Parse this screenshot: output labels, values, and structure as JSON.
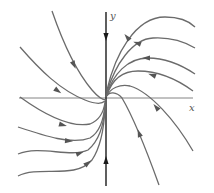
{
  "figure": {
    "type": "phase-portrait",
    "colors": {
      "axis": "#1a1a1a",
      "trajectory": "#6b6b6b",
      "background": "#ffffff"
    },
    "axes": {
      "x_label": "x",
      "y_label": "y"
    },
    "trajectories": {
      "right_upper": [
        {
          "id": "r1",
          "path": "M107,90 C115,55 135,17 165,17 C180,17 190,22 195,27"
        },
        {
          "id": "r2",
          "path": "M107,92 C115,65 132,39 153,38 C170,37 185,42 195,48"
        },
        {
          "id": "r3",
          "path": "M107,94 C113,75 127,58 148,58 C168,58 183,66 195,74"
        },
        {
          "id": "r4",
          "path": "M107,95 C112,80 122,71 138,71 C158,71 178,80 193,91"
        },
        {
          "id": "r5",
          "path": "M107,96 C110,88 120,84 130,86 C150,92 175,120 193,151"
        },
        {
          "id": "r6",
          "path": "M107,96 C109,92 116,91 122,98 C135,120 150,160 159,185"
        }
      ],
      "left": [
        {
          "id": "l1",
          "path": "M52,11 C62,40 75,70 92,90 C98,97 103,100 106,100"
        },
        {
          "id": "l2",
          "path": "M20,47 C40,70 60,90 85,100 C95,104 102,104 105,101"
        },
        {
          "id": "l3",
          "path": "M20,97 C45,115 70,128 90,124 C100,120 104,110 105,102"
        },
        {
          "id": "l4",
          "path": "M18,127 C45,136 72,145 90,138 C100,132 104,118 105,104"
        },
        {
          "id": "l5",
          "path": "M18,154 C40,145 70,158 88,150 C100,140 104,125 105,106"
        },
        {
          "id": "l6",
          "path": "M18,176 C40,165 75,180 92,160 C100,148 104,130 105,108"
        }
      ]
    },
    "arrows": [
      {
        "id": "a-yaxis-top",
        "x": 106,
        "y": 37,
        "angle": 90,
        "on": "y-axis"
      },
      {
        "id": "a-yaxis-bottom",
        "x": 106,
        "y": 160,
        "angle": -90,
        "on": "y-axis"
      },
      {
        "id": "a-r1",
        "x": 127,
        "y": 37,
        "angle": 230,
        "on": "r1"
      },
      {
        "id": "a-r2",
        "x": 137,
        "y": 43,
        "angle": 200,
        "on": "r2"
      },
      {
        "id": "a-r3",
        "x": 146,
        "y": 58,
        "angle": 180,
        "on": "r3"
      },
      {
        "id": "a-r4",
        "x": 152,
        "y": 75,
        "angle": 200,
        "on": "r4"
      },
      {
        "id": "a-r5",
        "x": 156,
        "y": 107,
        "angle": 230,
        "on": "r5"
      },
      {
        "id": "a-r6",
        "x": 139,
        "y": 133,
        "angle": 250,
        "on": "r6"
      },
      {
        "id": "a-l1",
        "x": 74,
        "y": 65,
        "angle": 65,
        "on": "l1"
      },
      {
        "id": "a-l2",
        "x": 58,
        "y": 91,
        "angle": 35,
        "on": "l2"
      },
      {
        "id": "a-l3",
        "x": 63,
        "y": 125,
        "angle": 15,
        "on": "l3"
      },
      {
        "id": "a-l4",
        "x": 69,
        "y": 141,
        "angle": 5,
        "on": "l4"
      },
      {
        "id": "a-l5",
        "x": 80,
        "y": 153,
        "angle": -20,
        "on": "l5"
      },
      {
        "id": "a-l6",
        "x": 88,
        "y": 163,
        "angle": -40,
        "on": "l6"
      }
    ]
  }
}
